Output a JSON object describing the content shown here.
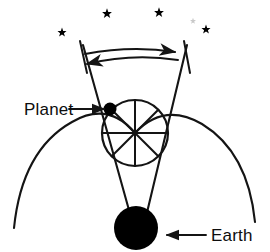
{
  "figure": {
    "type": "astronomy-diagram",
    "background_color": "#ffffff",
    "ink_color": "#141414"
  },
  "labels": {
    "planet": "Planet",
    "earth": "Earth"
  },
  "bodies": {
    "planet": {
      "name": "planet-body",
      "cx": 110,
      "cy": 109,
      "r": 6.5,
      "color": "#000000"
    },
    "earth": {
      "name": "earth-body",
      "cx": 136,
      "cy": 228,
      "r": 22,
      "color": "#000000"
    }
  },
  "epicycle": {
    "name": "epicycle-circle",
    "cx": 135,
    "cy": 133,
    "r": 33,
    "spoke_count": 8
  },
  "deferent": {
    "name": "deferent-arc",
    "left_end": [
      14,
      228
    ],
    "right_end": [
      255,
      222
    ],
    "apex": [
      135,
      133
    ]
  },
  "sight_lines": {
    "left_top": [
      83,
      45
    ],
    "right_top": [
      187,
      45
    ],
    "apex": [
      139,
      246
    ]
  },
  "motion_arrows": {
    "forward": {
      "name": "forward-motion-arrow",
      "direction": "right",
      "from": [
        85,
        54
      ],
      "to": [
        179,
        52
      ]
    },
    "retrograde": {
      "name": "retrograde-motion-arrow",
      "direction": "left",
      "from": [
        177,
        60
      ],
      "to": [
        83,
        64
      ]
    },
    "tick_left": [
      80,
      42,
      86,
      72
    ],
    "tick_right": [
      183,
      42,
      189,
      72
    ]
  },
  "pointers": {
    "planet_arrow": {
      "from": [
        69,
        109
      ],
      "to": [
        103,
        109
      ]
    },
    "earth_arrow": {
      "from": [
        206,
        235
      ],
      "to": [
        166,
        235
      ]
    }
  },
  "stars": [
    {
      "name": "star-1",
      "cx": 62,
      "cy": 32,
      "size": 4.0
    },
    {
      "name": "star-2",
      "cx": 107,
      "cy": 13,
      "size": 4.4
    },
    {
      "name": "star-3",
      "cx": 159,
      "cy": 12,
      "size": 4.4
    },
    {
      "name": "star-4",
      "cx": 206,
      "cy": 29,
      "size": 4.0
    },
    {
      "name": "star-5-faint",
      "cx": 193,
      "cy": 20,
      "size": 2.4
    }
  ]
}
